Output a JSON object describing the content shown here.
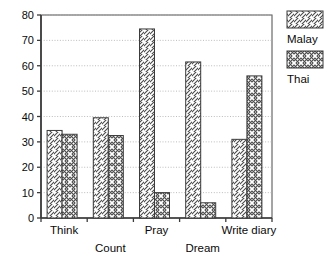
{
  "chart_data": {
    "type": "bar",
    "title": "",
    "subtitle": "",
    "xlabel": "",
    "ylabel": "",
    "categories": [
      "Think",
      "Count",
      "Pray",
      "Dream",
      "Write diary"
    ],
    "series": [
      {
        "name": "Malay",
        "values": [
          34.5,
          39.5,
          74.5,
          61.5,
          31
        ]
      },
      {
        "name": "Thai",
        "values": [
          33,
          32.5,
          10,
          6,
          56
        ]
      }
    ],
    "ylim": [
      0,
      80
    ],
    "ytick_values": [
      0,
      10,
      20,
      30,
      40,
      50,
      60,
      70,
      80
    ],
    "ytick_labels": [
      "0",
      "10",
      "20",
      "30",
      "40",
      "50",
      "60",
      "70",
      "80"
    ],
    "grid": "horizontal-dotted",
    "legend_position": "right",
    "legend_entries": [
      {
        "label": "Malay",
        "pattern": "diagonal-hatch"
      },
      {
        "label": "Thai",
        "pattern": "cross-hatch"
      }
    ],
    "colors": {
      "axis": "#3b3b3b",
      "grid": "#b4b4b4",
      "bar_outline": "#3b3b3b",
      "bar_fill": "#ffffff",
      "hatch": "#555555",
      "text": "#0a0a0a",
      "background": "#ffffff"
    },
    "category_label_rows": [
      {
        "label": "Think",
        "row": 0
      },
      {
        "label": "Count",
        "row": 1
      },
      {
        "label": "Pray",
        "row": 0
      },
      {
        "label": "Dream",
        "row": 1
      },
      {
        "label": "Write diary",
        "row": 0
      }
    ]
  }
}
